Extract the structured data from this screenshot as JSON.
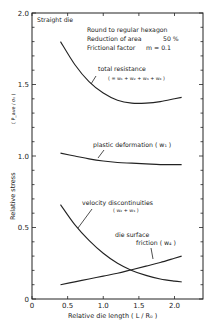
{
  "chart_data": {
    "type": "line",
    "title": "",
    "xlabel": "Relative die length   ( L / R₀ )",
    "ylabel": "Relative stress",
    "ylabel_ratio": "( P_ave / σ₀ )",
    "xlim": [
      0,
      2.4
    ],
    "ylim": [
      0,
      2.0
    ],
    "x_ticks": [
      0,
      0.5,
      1.0,
      1.5,
      2.0
    ],
    "x_tick_labels": [
      "0",
      "0.5",
      "1.0",
      "1.5",
      "2.0"
    ],
    "y_ticks": [
      0,
      0.5,
      1.0,
      1.5,
      2.0
    ],
    "y_tick_labels": [
      "0",
      "0.5",
      "1.0",
      "1.5",
      "2.0"
    ],
    "y_minor_step": 0.1,
    "grid": false,
    "legend": "inline annotations",
    "annotations": {
      "die_type": "Straight die",
      "conditions": [
        "Round to regular hexagon",
        "Reduction of area      50 %",
        "Frictional factor    m = 0.1"
      ]
    },
    "series": [
      {
        "name": "total resistance",
        "formula": "( = w₁ + w₂ + w₃ + w₄ )",
        "x": [
          0.4,
          0.6,
          0.8,
          1.0,
          1.2,
          1.4,
          1.6,
          1.8,
          2.0,
          2.1
        ],
        "values": [
          1.8,
          1.64,
          1.52,
          1.44,
          1.39,
          1.37,
          1.37,
          1.38,
          1.4,
          1.41
        ]
      },
      {
        "name": "plastic deformation",
        "formula": "( w₁ )",
        "x": [
          0.4,
          0.6,
          0.8,
          1.0,
          1.2,
          1.4,
          1.6,
          1.8,
          2.0,
          2.1
        ],
        "values": [
          1.02,
          1.0,
          0.98,
          0.965,
          0.955,
          0.95,
          0.945,
          0.94,
          0.94,
          0.94
        ]
      },
      {
        "name": "velocity discontinuities",
        "formula": "( w₂ + w₃ )",
        "x": [
          0.4,
          0.6,
          0.8,
          1.0,
          1.2,
          1.4,
          1.6,
          1.8,
          2.0,
          2.1
        ],
        "values": [
          0.66,
          0.52,
          0.41,
          0.32,
          0.25,
          0.2,
          0.165,
          0.14,
          0.125,
          0.12
        ]
      },
      {
        "name": "die surface friction",
        "formula": "( w₄ )",
        "x": [
          0.4,
          0.6,
          0.8,
          1.0,
          1.2,
          1.4,
          1.6,
          1.8,
          2.0,
          2.1
        ],
        "values": [
          0.1,
          0.12,
          0.14,
          0.16,
          0.18,
          0.205,
          0.23,
          0.255,
          0.285,
          0.3
        ]
      }
    ]
  },
  "labels": {
    "straight_die": "Straight die",
    "cond1": "Round to regular hexagon",
    "cond2a": "Reduction of area",
    "cond2b": "50 %",
    "cond3a": "Frictional factor",
    "cond3b": "m = 0.1",
    "total": "total resistance",
    "total_f": "( = w₁ + w₂ + w₃ + w₄ )",
    "plastic": "plastic deformation ( w₁ )",
    "velocity": "velocity discontinuities",
    "velocity_f": "( w₂ + w₃ )",
    "friction1": "die surface",
    "friction2": "friction ( w₄ )",
    "ylabel": "Relative stress",
    "ylabel_ratio": "( P_ave / σ₀ )",
    "xlabel": "Relative die length   ( L / R₀ )"
  }
}
